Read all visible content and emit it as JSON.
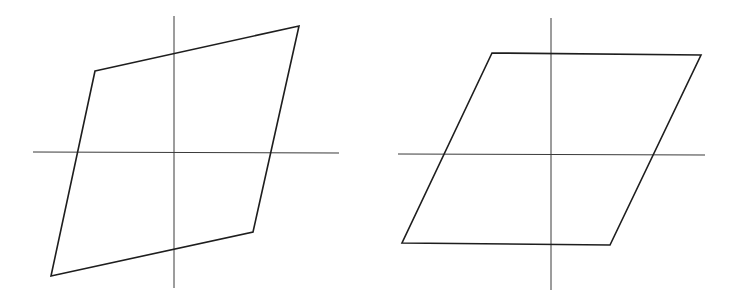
{
  "canvas": {
    "width": 734,
    "height": 300,
    "background": "#ffffff"
  },
  "colors": {
    "axis": "#3a3a3a",
    "loop": "#1e1e1e"
  },
  "diagrams": [
    {
      "name": "left-parallelogram",
      "axes": {
        "horizontal": {
          "x1": 33,
          "y1": 152,
          "x2": 339,
          "y2": 153
        },
        "vertical": {
          "x1": 174,
          "y1": 16,
          "x2": 174,
          "y2": 288
        }
      },
      "polygon": [
        [
          95,
          71
        ],
        [
          299,
          26
        ],
        [
          253,
          232
        ],
        [
          51,
          276
        ]
      ],
      "points": "95,71 299,26 253,232 51,276"
    },
    {
      "name": "right-parallelogram",
      "axes": {
        "horizontal": {
          "x1": 398,
          "y1": 154,
          "x2": 705,
          "y2": 155
        },
        "vertical": {
          "x1": 551,
          "y1": 18,
          "x2": 551,
          "y2": 290
        }
      },
      "polygon": [
        [
          492,
          53
        ],
        [
          701,
          55
        ],
        [
          610,
          245
        ],
        [
          402,
          243
        ]
      ],
      "points": "492,53 701,55 610,245 402,243"
    }
  ]
}
